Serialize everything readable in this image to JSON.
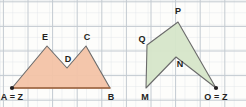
{
  "figure": {
    "grid": {
      "spacing": 12.3,
      "line_color": "#c9cfd6",
      "minor_line_color": "#dde2e7",
      "background": "#fdfdfb",
      "visible": true
    },
    "shapes": [
      {
        "id": "shape-left",
        "name": "polygon-abcde",
        "fill": "#f3c3a6",
        "fill_opacity": 0.95,
        "stroke": "#6b6b6b",
        "stroke_width": 1.1,
        "points": "12,88 47,46 67,68 86,46 110,88",
        "vertices": [
          {
            "label": "A = Z",
            "x": 12,
            "y": 88,
            "lx": 12,
            "ly": 100,
            "anchor": "middle",
            "marker": true
          },
          {
            "label": "E",
            "x": 47,
            "y": 46,
            "lx": 45,
            "ly": 40,
            "anchor": "middle",
            "marker": false
          },
          {
            "label": "D",
            "x": 67,
            "y": 68,
            "lx": 68,
            "ly": 62,
            "anchor": "middle",
            "marker": false
          },
          {
            "label": "C",
            "x": 86,
            "y": 46,
            "lx": 87,
            "ly": 40,
            "anchor": "middle",
            "marker": false
          },
          {
            "label": "B",
            "x": 110,
            "y": 88,
            "lx": 111,
            "ly": 100,
            "anchor": "middle",
            "marker": false
          }
        ]
      },
      {
        "id": "shape-right",
        "name": "polygon-mnopq",
        "fill": "#d6e6c9",
        "fill_opacity": 0.95,
        "stroke": "#6b6b6b",
        "stroke_width": 1.1,
        "points": "146,88 176,57 216,88 178,22 147,45",
        "vertices": [
          {
            "label": "M",
            "x": 146,
            "y": 88,
            "lx": 145,
            "ly": 100,
            "anchor": "middle",
            "marker": false
          },
          {
            "label": "N",
            "x": 176,
            "y": 57,
            "lx": 180,
            "ly": 67,
            "anchor": "middle",
            "marker": false
          },
          {
            "label": "O = Z",
            "x": 216,
            "y": 88,
            "lx": 216,
            "ly": 100,
            "anchor": "middle",
            "marker": true
          },
          {
            "label": "P",
            "x": 178,
            "y": 22,
            "lx": 178,
            "ly": 14,
            "anchor": "middle",
            "marker": false
          },
          {
            "label": "Q",
            "x": 147,
            "y": 45,
            "lx": 142,
            "ly": 42,
            "anchor": "middle",
            "marker": false
          }
        ]
      }
    ],
    "markers": [
      {
        "name": "center-point-a",
        "x": 12,
        "y": 88,
        "r": 2.1,
        "color": "#231f20"
      },
      {
        "name": "center-point-o",
        "x": 216,
        "y": 88,
        "r": 2.1,
        "color": "#231f20"
      }
    ],
    "base_segments": [
      {
        "name": "base-segment-ab",
        "x1": 12,
        "y1": 88,
        "x2": 110,
        "y2": 88,
        "color": "#a9683f",
        "width": 1.3
      }
    ]
  }
}
